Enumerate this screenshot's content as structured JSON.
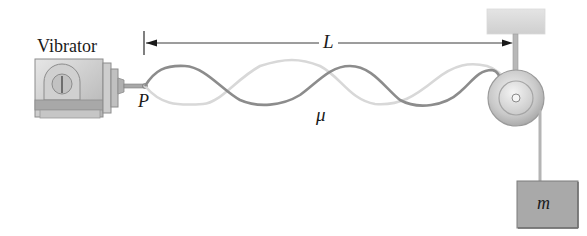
{
  "diagram": {
    "labels": {
      "vibrator": "Vibrator",
      "length": "L",
      "point": "P",
      "linear_density": "μ",
      "mass": "m"
    },
    "components": [
      {
        "id": "vibrator",
        "label": "Vibrator"
      },
      {
        "id": "string",
        "label": "μ",
        "description": "standing wave with 3 loops shown in two extreme positions"
      },
      {
        "id": "point-p",
        "label": "P"
      },
      {
        "id": "length-dimension",
        "label": "L"
      },
      {
        "id": "pulley"
      },
      {
        "id": "ceiling-support"
      },
      {
        "id": "hanging-mass",
        "label": "m"
      }
    ],
    "colors": {
      "string_dark": "#8a8a8a",
      "string_light": "#d6d6d6",
      "metal": "#b8b8b8",
      "mass_fill": "#a9a9a9",
      "text": "#1a1a1a"
    }
  }
}
